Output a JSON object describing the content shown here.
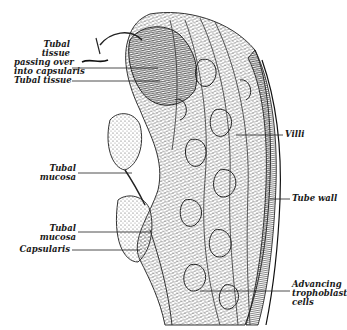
{
  "figure": {
    "type": "histology-illustration",
    "colors": {
      "background": "#ffffff",
      "ink": "#1a1a1a",
      "tissue_dark": "#2a2a2a",
      "tissue_mid": "#6a6a6a"
    }
  },
  "labels": {
    "tubal_tissue_over": {
      "lines": [
        "Tubal",
        "tissue",
        "passing over",
        "into capsularis"
      ]
    },
    "tubal_tissue": {
      "text": "Tubal tissue"
    },
    "tubal_mucosa_1": {
      "lines": [
        "Tubal",
        "mucosa"
      ]
    },
    "tubal_mucosa_2": {
      "lines": [
        "Tubal",
        "mucosa"
      ]
    },
    "capsularis": {
      "text": "Capsularis"
    },
    "villi": {
      "text": "Villi"
    },
    "tube_wall": {
      "text": "Tube wall"
    },
    "advancing_trophoblast": {
      "lines": [
        "Advancing",
        "trophoblast",
        "cells"
      ]
    }
  }
}
